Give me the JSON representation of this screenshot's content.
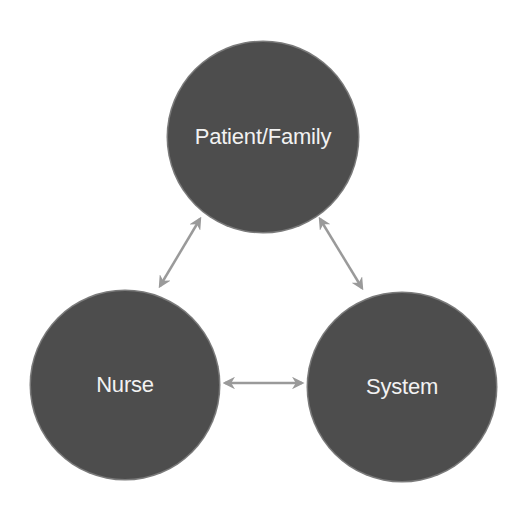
{
  "diagram": {
    "type": "triangle-relationship",
    "nodes": [
      {
        "id": "patient_family",
        "label": "Patient/Family",
        "cx": 263,
        "cy": 137,
        "r": 95
      },
      {
        "id": "nurse",
        "label": "Nurse",
        "cx": 125,
        "cy": 385,
        "r": 94
      },
      {
        "id": "system",
        "label": "System",
        "cx": 402,
        "cy": 387,
        "r": 94
      }
    ],
    "edges": [
      {
        "from": "patient_family",
        "to": "nurse",
        "direction": "bidirectional"
      },
      {
        "from": "patient_family",
        "to": "system",
        "direction": "bidirectional"
      },
      {
        "from": "nurse",
        "to": "system",
        "direction": "bidirectional"
      }
    ],
    "colors": {
      "node_fill": "#4d4d4d",
      "node_border": "#7a7a7a",
      "label": "#f2f2f2",
      "arrow": "#9a9a9a",
      "background": "#ffffff"
    }
  }
}
